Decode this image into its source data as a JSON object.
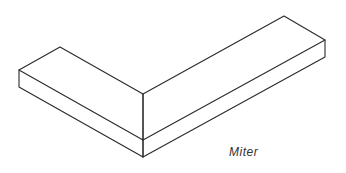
{
  "diagram": {
    "label": "Miter",
    "colors": {
      "line": "#2a2a2a",
      "background": "#ffffff"
    }
  }
}
